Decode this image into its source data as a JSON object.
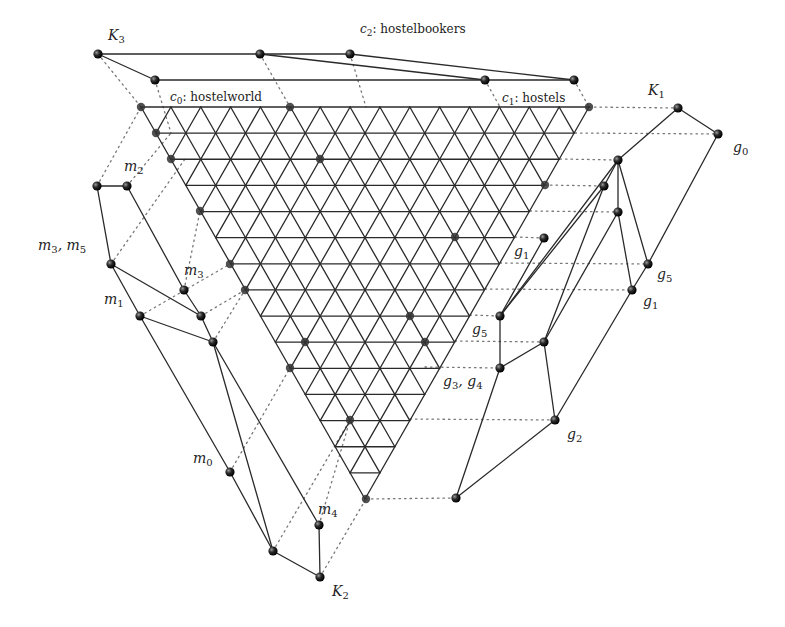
{
  "diagram": {
    "type": "triangular-grid-with-concept-lattices",
    "colors": {
      "line": "#2a2a2a",
      "node": "#1a1a1a",
      "dotted": "#777777",
      "background": "#ffffff"
    },
    "grid": {
      "rows": 15,
      "top_left": [
        141,
        107
      ],
      "top_right": [
        589,
        107
      ],
      "apex": [
        366,
        499
      ]
    },
    "corner_labels": {
      "c0": {
        "sym": "c",
        "sub": "0",
        "name": ": hostelworld"
      },
      "c1": {
        "sym": "c",
        "sub": "1",
        "name": ": hostels"
      },
      "c2": {
        "sym": "c",
        "sub": "2",
        "name": ": hostelbookers"
      }
    },
    "lattice_labels": {
      "K1": {
        "sym": "K",
        "sub": "1"
      },
      "K2": {
        "sym": "K",
        "sub": "2"
      },
      "K3": {
        "sym": "K",
        "sub": "3"
      }
    },
    "node_labels": {
      "g0": {
        "sym": "g",
        "sub": "0"
      },
      "g1a": {
        "sym": "g",
        "sub": "1"
      },
      "g1b": {
        "sym": "g",
        "sub": "1"
      },
      "g5a": {
        "sym": "g",
        "sub": "5"
      },
      "g5b": {
        "sym": "g",
        "sub": "5"
      },
      "g34": {
        "text": "g",
        "sub": "3",
        "text2": ", g",
        "sub2": "4"
      },
      "g2": {
        "sym": "g",
        "sub": "2"
      },
      "m2": {
        "sym": "m",
        "sub": "2"
      },
      "m35": {
        "text": "m",
        "sub": "3",
        "text2": ", m",
        "sub2": "5"
      },
      "m3": {
        "sym": "m",
        "sub": "3"
      },
      "m1": {
        "sym": "m",
        "sub": "1"
      },
      "m0": {
        "sym": "m",
        "sub": "0"
      },
      "m4": {
        "sym": "m",
        "sub": "4"
      }
    }
  }
}
